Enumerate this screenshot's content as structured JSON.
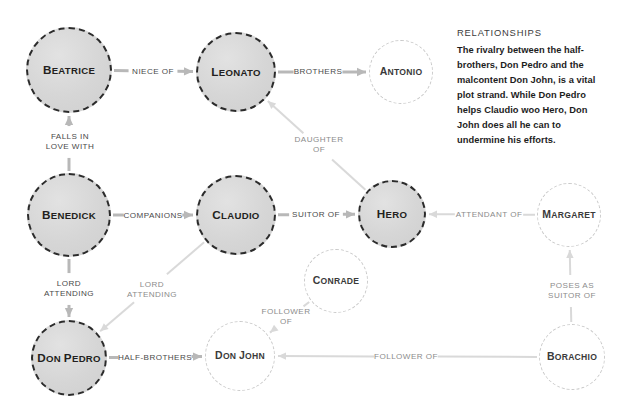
{
  "diagram": {
    "nodes": [
      {
        "id": "beatrice",
        "label": "Beatrice",
        "type": "major",
        "cx": 69,
        "cy": 70,
        "r": 43
      },
      {
        "id": "leonato",
        "label": "Leonato",
        "type": "major",
        "cx": 236,
        "cy": 72,
        "r": 40
      },
      {
        "id": "antonio",
        "label": "Antonio",
        "type": "minor",
        "cx": 401,
        "cy": 72,
        "r": 32
      },
      {
        "id": "benedick",
        "label": "Benedick",
        "type": "major",
        "cx": 69,
        "cy": 215,
        "r": 42
      },
      {
        "id": "claudio",
        "label": "Claudio",
        "type": "major",
        "cx": 236,
        "cy": 215,
        "r": 40
      },
      {
        "id": "hero",
        "label": "Hero",
        "type": "major",
        "cx": 392,
        "cy": 214,
        "r": 34
      },
      {
        "id": "margaret",
        "label": "Margaret",
        "type": "minor",
        "cx": 569,
        "cy": 215,
        "r": 32
      },
      {
        "id": "conrade",
        "label": "Conrade",
        "type": "minor",
        "cx": 336,
        "cy": 281,
        "r": 32
      },
      {
        "id": "donpedro",
        "label": "Don Pedro",
        "type": "major",
        "cx": 69,
        "cy": 358,
        "r": 38
      },
      {
        "id": "donjohn",
        "label": "Don John",
        "type": "minor",
        "cx": 240,
        "cy": 356,
        "r": 35
      },
      {
        "id": "borachio",
        "label": "Borachio",
        "type": "minor",
        "cx": 572,
        "cy": 357,
        "r": 33
      }
    ],
    "edges": [
      {
        "id": "beatrice-leonato",
        "from": "beatrice",
        "to": "leonato",
        "label": "NIECE OF",
        "label_x": 153,
        "label_y": 72,
        "weight": "dark"
      },
      {
        "id": "leonato-antonio",
        "from": "leonato",
        "to": "antonio",
        "label": "BROTHERS",
        "label_x": 318,
        "label_y": 72,
        "weight": "dark"
      },
      {
        "id": "benedick-beatrice",
        "from": "benedick",
        "to": "beatrice",
        "label": "FALLS IN\nLOVE WITH",
        "label_x": 70,
        "label_y": 142,
        "weight": "dark"
      },
      {
        "id": "hero-leonato",
        "from": "hero",
        "to": "leonato",
        "label": "DAUGHTER\nOF",
        "label_x": 319,
        "label_y": 145,
        "weight": "light"
      },
      {
        "id": "benedick-claudio",
        "from": "benedick",
        "to": "claudio",
        "label": "COMPANIONS",
        "label_x": 153,
        "label_y": 216,
        "weight": "dark"
      },
      {
        "id": "claudio-hero",
        "from": "claudio",
        "to": "hero",
        "label": "SUITOR OF",
        "label_x": 316,
        "label_y": 215,
        "weight": "dark"
      },
      {
        "id": "margaret-hero",
        "from": "margaret",
        "to": "hero",
        "label": "ATTENDANT OF",
        "label_x": 489,
        "label_y": 215,
        "weight": "light"
      },
      {
        "id": "benedick-donpedro",
        "from": "benedick",
        "to": "donpedro",
        "label": "LORD\nATTENDING",
        "label_x": 69,
        "label_y": 289,
        "weight": "dark"
      },
      {
        "id": "claudio-donpedro",
        "from": "claudio",
        "to": "donpedro",
        "label": "LORD\nATTENDING",
        "label_x": 152,
        "label_y": 290,
        "weight": "light"
      },
      {
        "id": "conrade-donjohn",
        "from": "conrade",
        "to": "donjohn",
        "label": "FOLLOWER\nOF",
        "label_x": 286,
        "label_y": 317,
        "weight": "light"
      },
      {
        "id": "donpedro-donjohn",
        "from": "donpedro",
        "to": "donjohn",
        "label": "HALF-BROTHERS",
        "label_x": 155,
        "label_y": 358,
        "weight": "dark"
      },
      {
        "id": "borachio-donjohn",
        "from": "borachio",
        "to": "donjohn",
        "label": "FOLLOWER OF",
        "label_x": 406,
        "label_y": 357,
        "weight": "light"
      },
      {
        "id": "borachio-margaret",
        "from": "borachio",
        "to": "margaret",
        "label": "POSES AS\nSUITOR OF",
        "label_x": 572,
        "label_y": 291,
        "weight": "light"
      }
    ]
  },
  "panel": {
    "title": "RELATIONSHIPS",
    "body": "The rivalry between the half-brothers, Don Pedro and the malcontent Don John, is a vital plot strand. While Don Pedro helps Claudio woo Hero, Don John does all he can to undermine his efforts."
  },
  "colors": {
    "node_major_border": "#2b2b2b",
    "node_major_fill": "#d6d6d6",
    "node_minor_border": "#c9c9c9",
    "edge_dark": "#b3b3b3",
    "edge_light": "#d6d6d6",
    "text": "#231f20",
    "background": "#ffffff"
  }
}
